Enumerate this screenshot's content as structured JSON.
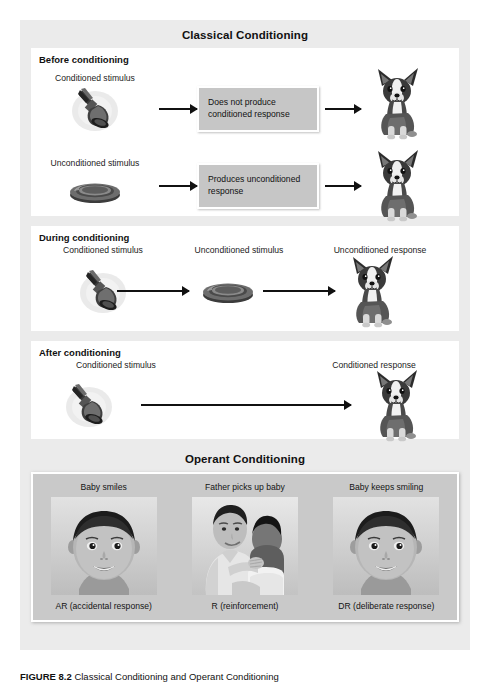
{
  "figure": {
    "classical_title": "Classical Conditioning",
    "operant_title": "Operant Conditioning",
    "caption_number": "FIGURE 8.2",
    "caption_text": "Classical Conditioning and Operant Conditioning"
  },
  "colors": {
    "figure_background": "#ebebeb",
    "panel_background": "#ffffff",
    "textbox_background": "#c6c6c6",
    "operant_panel_background": "#c9c9c9",
    "arrow": "#111111",
    "text": "#1a1a1a"
  },
  "classical": {
    "panels": [
      {
        "heading": "Before conditioning",
        "rows": [
          {
            "stimulus_label": "Conditioned stimulus",
            "stimulus_icon": "bell-icon",
            "textbox": "Does not produce conditioned response",
            "response_icon": "dog-icon"
          },
          {
            "stimulus_label": "Unconditioned stimulus",
            "stimulus_icon": "food-bowl-icon",
            "textbox": "Produces unconditioned response",
            "response_icon": "dog-icon"
          }
        ]
      },
      {
        "heading": "During conditioning",
        "labels": [
          "Conditioned stimulus",
          "Unconditioned stimulus",
          "Unconditioned response"
        ],
        "icons": [
          "bell-icon",
          "food-bowl-icon",
          "dog-icon"
        ]
      },
      {
        "heading": "After conditioning",
        "labels": [
          "Conditioned stimulus",
          "Conditioned response"
        ],
        "icons": [
          "bell-icon",
          "dog-icon"
        ]
      }
    ]
  },
  "operant": {
    "photos": [
      {
        "top_caption": "Baby smiles",
        "bottom_caption": "AR (accidental response)",
        "image": "baby-smiling-photo"
      },
      {
        "top_caption": "Father picks up baby",
        "bottom_caption": "R (reinforcement)",
        "image": "father-holding-baby-photo"
      },
      {
        "top_caption": "Baby keeps smiling",
        "bottom_caption": "DR (deliberate response)",
        "image": "baby-smiling-photo"
      }
    ]
  }
}
